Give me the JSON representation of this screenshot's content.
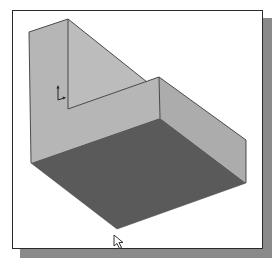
{
  "viewport": {
    "label": "3D model graphics window",
    "background": "#ffffff",
    "border_color": "#2a2a2a",
    "shadow_color": "#8a8a8a"
  },
  "model": {
    "type": "L-shaped wall solid on base plate, isometric view",
    "colors": {
      "wall_face": "#b4b4b4",
      "wall_face_light": "#bdbdbd",
      "side_face": "#a9a9a9",
      "floor": "#5a5a5a",
      "edge": "#3a3a3a"
    }
  },
  "triad": {
    "icon": "coordinate-axis-triad"
  },
  "cursor": {
    "icon": "mouse-pointer-arrow"
  }
}
